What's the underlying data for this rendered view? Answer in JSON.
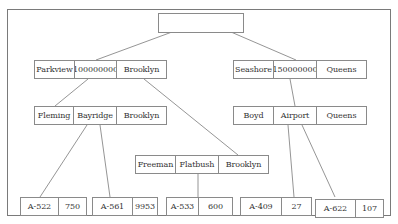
{
  "diagram": {
    "type": "b-plus-tree-index",
    "root": {
      "cells": []
    },
    "internal_left": {
      "cells": [
        "Parkview",
        "100000000",
        "Brooklyn"
      ]
    },
    "internal_right": {
      "cells": [
        "Seashore",
        "150000000",
        "Queens"
      ]
    },
    "level2_left": {
      "cells": [
        "Fleming",
        "Bayridge",
        "Brooklyn"
      ]
    },
    "level2_right": {
      "cells": [
        "Boyd",
        "Airport",
        "Queens"
      ]
    },
    "level3_mid": {
      "cells": [
        "Freeman",
        "Flatbush",
        "Brooklyn"
      ]
    },
    "leaves": [
      {
        "account": "A-522",
        "balance": "750"
      },
      {
        "account": "A-561",
        "balance": "9953"
      },
      {
        "account": "A-533",
        "balance": "600"
      },
      {
        "account": "A-409",
        "balance": "27"
      },
      {
        "account": "A-622",
        "balance": "107"
      }
    ]
  },
  "colors": {
    "line": "#7a7a7a",
    "border": "#8a8a8a",
    "text": "#333333",
    "background": "#ffffff"
  }
}
